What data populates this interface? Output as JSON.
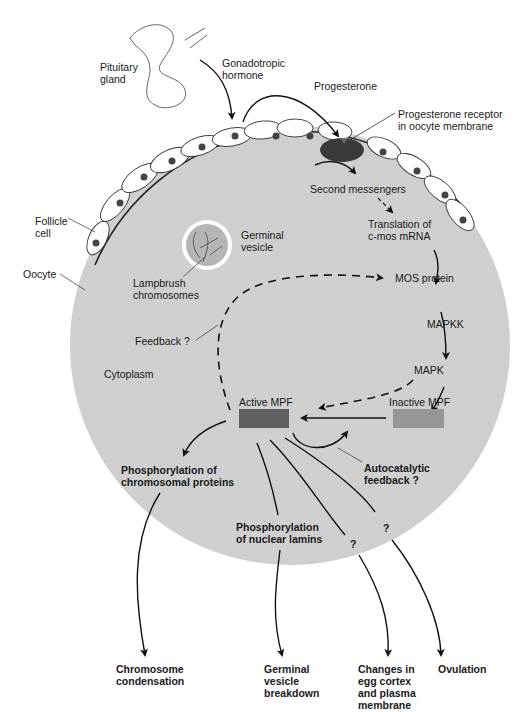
{
  "diagram": {
    "colors": {
      "background": "#ffffff",
      "cytoplasm": "#cfcfcf",
      "germinal_vesicle_fill": "#b5b5b5",
      "receptor": "#3a3a3a",
      "active_mpf": "#5f5f5f",
      "inactive_mpf": "#969696",
      "line": "#111111"
    },
    "labels": {
      "pituitary": "Pituitary\ngland",
      "gonadotropic": "Gonadotropic\nhormone",
      "progesterone": "Progesterone",
      "receptor": "Progesterone receptor\nin oocyte membrane",
      "second_messengers": "Second messengers",
      "translation": "Translation of\nc-mos mRNA",
      "follicle_cell": "Follicle\ncell",
      "germinal_vesicle": "Germinal\nvesicle",
      "oocyte": "Oocyte",
      "lampbrush": "Lampbrush\nchromosomes",
      "mos_protein": "MOS protein",
      "mapkk": "MAPKK",
      "mapk": "MAPK",
      "feedback": "Feedback ?",
      "cytoplasm": "Cytoplasm",
      "active_mpf": "Active MPF",
      "inactive_mpf": "Inactive MPF",
      "phos_chrom": "Phosphorylation of\nchromosomal proteins",
      "autocatalytic": "Autocatalytic\nfeedback ?",
      "phos_lamins": "Phosphorylation\nof nuclear lamins",
      "q1": "?",
      "q2": "?",
      "out_condensation": "Chromosome\ncondensation",
      "out_gvbd": "Germinal\nvesicle\nbreakdown",
      "out_cortex": "Changes in\negg cortex\nand plasma\nmembrane",
      "out_ovulation": "Ovulation"
    }
  }
}
